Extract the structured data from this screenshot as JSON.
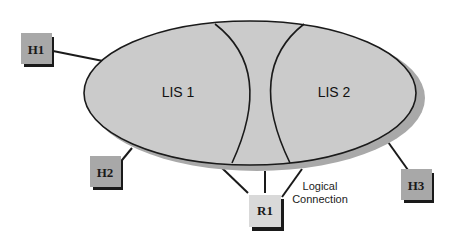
{
  "diagram": {
    "type": "network-topology",
    "colors": {
      "ellipse_fill": "#cbcbcb",
      "ellipse_shadow": "#a9a9a9",
      "node_fill": "#a8a8a8",
      "router_fill": "#d9d9d9",
      "line": "#1a1a1a"
    },
    "regions": [
      {
        "id": "lis1",
        "label": "LIS 1"
      },
      {
        "id": "lis2",
        "label": "LIS 2"
      }
    ],
    "nodes": [
      {
        "id": "h1",
        "label": "H1"
      },
      {
        "id": "h2",
        "label": "H2"
      },
      {
        "id": "h3",
        "label": "H3"
      },
      {
        "id": "r1",
        "label": "R1"
      }
    ],
    "annotations": {
      "logical_connection_line1": "Logical",
      "logical_connection_line2": "Connection"
    }
  }
}
